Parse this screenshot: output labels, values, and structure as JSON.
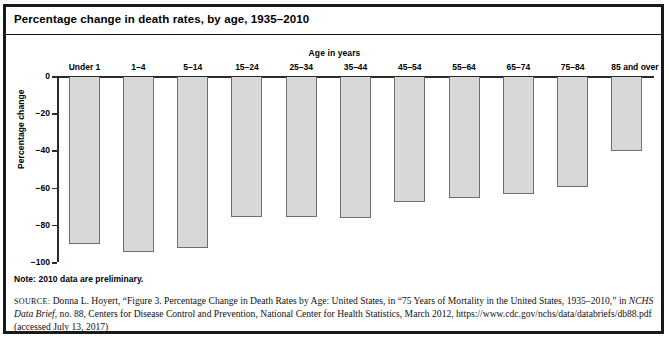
{
  "figure": {
    "title": "Percentage change in death rates, by age, 1935–2010",
    "note": "Note: 2010 data are preliminary.",
    "source": {
      "label": "SOURCE:",
      "line1_a": " Donna L. Hoyert, “Figure 3. Percentage Change in Death Rates by Age: United States,",
      "line2_a": "1935–2010,” in ",
      "line2_italic": "NCHS Data Brief",
      "line2_b": ", no. 88, Centers for Disease Control and Prevention, National Center for Health Statistics, March 2012,",
      "line1_tail": " in “75 Years of Mortality in the United States,",
      "line3": "https://www.cdc.gov/nchs/data/databriefs/db88.pdf (accessed July 13, 2017)"
    }
  },
  "chart_data": {
    "type": "bar",
    "title": "Percentage change in death rates, by age, 1935–2010",
    "xlabel": "Age in years",
    "ylabel": "Percentage change",
    "categories": [
      "Under 1",
      "1–4",
      "5–14",
      "15–24",
      "25–34",
      "35–44",
      "45–54",
      "55–64",
      "65–74",
      "75–84",
      "85 and over"
    ],
    "values": [
      -90,
      -94,
      -92,
      -75,
      -75,
      -76,
      -67,
      -65,
      -63,
      -59,
      -40
    ],
    "ylim": [
      -100,
      0
    ],
    "yticks": [
      0,
      -20,
      -40,
      -60,
      -80,
      -100
    ],
    "ytick_labels": [
      "0",
      "−20",
      "−40",
      "−60",
      "−80",
      "−100"
    ],
    "grid": false,
    "legend": "none",
    "bar_fill": "#d8d8d8",
    "bar_edge": "#6e6e6e"
  }
}
